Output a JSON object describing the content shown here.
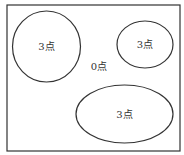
{
  "diagram": {
    "type": "target-regions",
    "stroke_color": "#333333",
    "background": "#ffffff",
    "frame": {
      "x": 7,
      "y": 5,
      "width": 173,
      "height": 146
    },
    "regions": [
      {
        "id": "left-circle",
        "label": "3点",
        "cx": 46.5,
        "cy": 46.5,
        "rx": 34,
        "ry": 35.5
      },
      {
        "id": "top-right-circle",
        "label": "3点",
        "cx": 145,
        "cy": 44.5,
        "rx": 28,
        "ry": 23.5
      },
      {
        "id": "bottom-ellipse",
        "label": "3点",
        "cx": 124.5,
        "cy": 114,
        "rx": 48.5,
        "ry": 29
      }
    ],
    "outside_label": {
      "label": "0点",
      "x": 99,
      "y": 66
    }
  }
}
